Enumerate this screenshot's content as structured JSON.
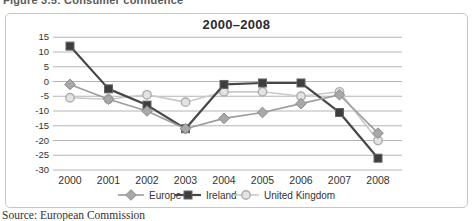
{
  "caption": "Figure 3.5: Consumer confidence",
  "source": "Source: European Commission",
  "colors": {
    "gridline": "#ababab",
    "axis_text": "#333333",
    "title_text": "#2b2b2b",
    "box_border": "#c6c6c6",
    "legend_text": "#333333"
  },
  "chart_data": {
    "type": "line",
    "title": "2000–2008",
    "categories": [
      "2000",
      "2001",
      "2002",
      "2003",
      "2004",
      "2005",
      "2006",
      "2007",
      "2008"
    ],
    "yticks": [
      15,
      10,
      5,
      0,
      -5,
      -10,
      -15,
      -20,
      -25,
      -30
    ],
    "ylim": [
      -30,
      15
    ],
    "grid": "horizontal",
    "legend_position": "bottom",
    "series": [
      {
        "name": "Europe",
        "marker": "diamond",
        "line_color": "#9c9c9c",
        "marker_fill": "#a8a8a8",
        "marker_edge": "#8a8a8a",
        "line_width": 1.6,
        "values": [
          -1,
          -6,
          -10,
          -16,
          -12.5,
          -10.5,
          -7.5,
          -4.5,
          -17.5
        ]
      },
      {
        "name": "Ireland",
        "marker": "square",
        "line_color": "#474747",
        "marker_fill": "#3e3e3e",
        "marker_edge": "#656565",
        "line_width": 2.2,
        "values": [
          12,
          -2.5,
          -8,
          -16,
          -1,
          -0.5,
          -0.5,
          -10.5,
          -26
        ]
      },
      {
        "name": "United Kingdom",
        "marker": "circle",
        "line_color": "#c9c9c9",
        "marker_fill": "#e3e3e3",
        "marker_edge": "#adadad",
        "line_width": 1.6,
        "values": [
          -5.5,
          -6,
          -4.5,
          -7,
          -3.5,
          -3.5,
          -5,
          -3.5,
          -20
        ]
      }
    ]
  }
}
